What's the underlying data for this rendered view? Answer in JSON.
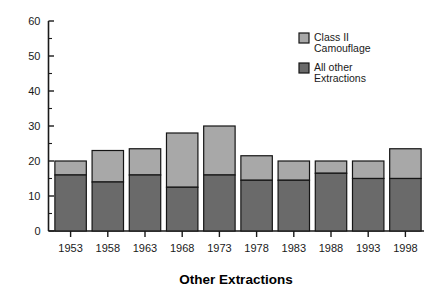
{
  "chart_data": {
    "type": "bar",
    "title": "",
    "xlabel": "Other Extractions",
    "ylabel": "",
    "stacked": true,
    "grid": false,
    "legend_position": "top-right",
    "categories": [
      "1953",
      "1958",
      "1963",
      "1968",
      "1973",
      "1978",
      "1983",
      "1988",
      "1993",
      "1998"
    ],
    "series": [
      {
        "name": "All other Extractions",
        "color": "#6a6a6a",
        "values": [
          16,
          14,
          16,
          12.5,
          16,
          14.5,
          14.5,
          16.5,
          15,
          15
        ]
      },
      {
        "name": "Class II Camouflage",
        "color": "#a8a8a8",
        "values": [
          4,
          9,
          7.5,
          15.5,
          14,
          7,
          5.5,
          3.5,
          5,
          8.5
        ]
      }
    ],
    "totals": [
      20,
      23,
      23.5,
      28,
      30,
      21.5,
      20,
      20,
      20,
      23.5
    ],
    "ylim": [
      0,
      60
    ],
    "ytick_labels": [
      "0",
      "10",
      "20",
      "30",
      "40",
      "50",
      "60"
    ],
    "ytick_values": [
      0,
      10,
      20,
      30,
      40,
      50,
      60
    ],
    "yminor_values": [
      5,
      15,
      25,
      35,
      45,
      55
    ]
  },
  "legend": {
    "items": [
      {
        "label_line1": "Class II",
        "label_line2": "Camouflage",
        "color": "#a8a8a8"
      },
      {
        "label_line1": "All other",
        "label_line2": "Extractions",
        "color": "#6a6a6a"
      }
    ]
  },
  "axis": {
    "x_title": "Other Extractions"
  },
  "colors": {
    "class_ii_camouflage": "#a8a8a8",
    "all_other_extractions": "#6a6a6a",
    "axis": "#1a1a1a",
    "background": "#ffffff"
  }
}
